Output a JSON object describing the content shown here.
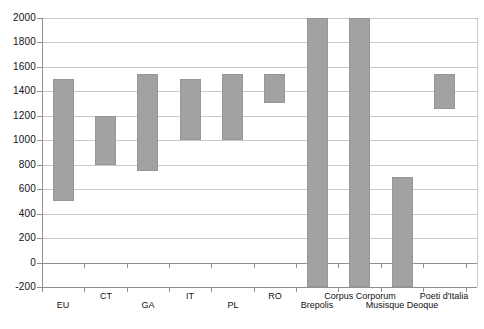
{
  "chart_data": {
    "type": "bar",
    "subtype": "floating_range_columns",
    "orientation": "vertical",
    "title": "",
    "xlabel": "",
    "ylabel": "",
    "categories": [
      "EU",
      "CT",
      "GA",
      "IT",
      "PL",
      "RO",
      "Brepolis",
      "Corpus Corporum",
      "Musisque Deoque",
      "Poeti d'Italia"
    ],
    "series": [
      {
        "name": "range",
        "ranges": [
          [
            500,
            1500
          ],
          [
            800,
            1200
          ],
          [
            750,
            1540
          ],
          [
            1000,
            1500
          ],
          [
            1000,
            1540
          ],
          [
            1300,
            1540
          ],
          [
            -200,
            2000
          ],
          [
            -200,
            2000
          ],
          [
            -200,
            700
          ],
          [
            1250,
            1540
          ]
        ]
      }
    ],
    "ylim": [
      -200,
      2000
    ],
    "ytick_step": 200,
    "ytick_labels": [
      "2000",
      "1800",
      "1600",
      "1400",
      "1200",
      "1000",
      "800",
      "600",
      "400",
      "200",
      "0",
      "-200"
    ],
    "grid": true,
    "legend": false,
    "layout_hints": {
      "x_labels_staggered": "two rows; EU, GA, PL, Brepolis, Musisque Deoque on lower row; CT, IT, RO, Corpus Corporum, Poeti d'Italia on upper row",
      "clipped_bars": "Brepolis, Corpus Corporum and Musisque Deoque columns run to the bottom plot edge (clipped at -200); Brepolis and Corpus Corporum also reach the 2000 top edge",
      "zero_axis_line": true,
      "bottom_edge_line": true,
      "category_boundary_ticks": "short ticks below the 0 line and below the -200 line"
    },
    "colors": {
      "bar_fill": "#a2a2a2",
      "bar_edge": "#969696",
      "gridline": "#c9c9c9",
      "axis_line": "#8f8f8f",
      "label_text": "#111111",
      "background": "#ffffff"
    }
  }
}
